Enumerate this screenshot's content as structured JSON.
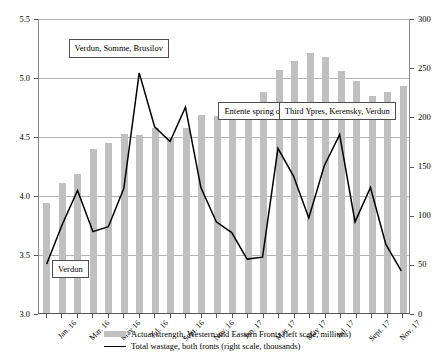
{
  "chart_data": {
    "type": "bar",
    "title": "",
    "xlabel": "",
    "ylabel": "",
    "grid": true,
    "legend_position": "bottom",
    "y_left": {
      "label": "Actual strength, Western and Eastern Fronts (left scale, millions)",
      "ticks": [
        "3.0",
        "3.5",
        "4.0",
        "4.5",
        "5.0",
        "5.5"
      ],
      "min": 3.0,
      "max": 5.5
    },
    "y_right": {
      "label": "Total wastage, both fronts (right scale, thousands)",
      "ticks": [
        "0",
        "50",
        "100",
        "150",
        "200",
        "250",
        "300"
      ],
      "min": 0,
      "max": 300
    },
    "categories": [
      "Jan. 16",
      "Feb. 16",
      "Mar. 16",
      "Apr. 16",
      "May 16",
      "June 16",
      "Jul. 16",
      "Aug. 16",
      "Sept. 16",
      "Oct. 16",
      "Nov. 16",
      "Dec. 16",
      "Jan. 17",
      "Feb. 17",
      "Mar. 17",
      "Apr. 17",
      "May 17",
      "June 17",
      "Jul. 17",
      "Aug. 17",
      "Sept. 17",
      "Oct. 17",
      "Nov. 17",
      "Dec. 17"
    ],
    "x_tick_labels": [
      "Jan. 16",
      "Mar. 16",
      "May 16",
      "Jul. 16",
      "Sept. 16",
      "Nov. 16",
      "Jan. 17",
      "Mar. 17",
      "May 17",
      "Jul. 17",
      "Sept. 17",
      "Nov. 17"
    ],
    "series": [
      {
        "name": "Actual strength, Western and Eastern Fronts (left scale, millions)",
        "type": "bar",
        "axis": "left",
        "color": "#c0c0c0",
        "values": [
          3.93,
          4.1,
          4.18,
          4.39,
          4.44,
          4.52,
          4.51,
          4.57,
          4.49,
          4.57,
          4.68,
          4.67,
          4.69,
          4.79,
          4.87,
          5.06,
          5.14,
          5.2,
          5.17,
          5.05,
          4.97,
          4.84,
          4.87,
          4.92
        ]
      },
      {
        "name": "Total wastage, both fronts (right scale, thousands)",
        "type": "line",
        "axis": "right",
        "color": "#000000",
        "values": [
          50,
          90,
          125,
          83,
          88,
          127,
          245,
          190,
          175,
          210,
          128,
          93,
          82,
          55,
          57,
          168,
          140,
          97,
          150,
          182,
          93,
          128,
          70,
          43
        ]
      }
    ],
    "annotations": [
      {
        "text": "Verdun",
        "x_index": 1.6,
        "y_value": 3.38
      },
      {
        "text": "Verdun, Somme, Brusilov",
        "x_index": 4.7,
        "y_value": 5.25
      },
      {
        "text": "Entente spring offensive",
        "x_index": 14.2,
        "y_value": 4.72
      },
      {
        "text": "Third Ypres, Kerensky, Verdun",
        "x_index": 18.8,
        "y_value": 4.72
      }
    ]
  },
  "legend": {
    "items": [
      {
        "marker": "bar-swatch",
        "label": "Actual strength, Western and Eastern Fronts (left scale, millions)"
      },
      {
        "marker": "line-swatch",
        "label": "Total wastage, both fronts (right scale, thousands)"
      }
    ]
  }
}
